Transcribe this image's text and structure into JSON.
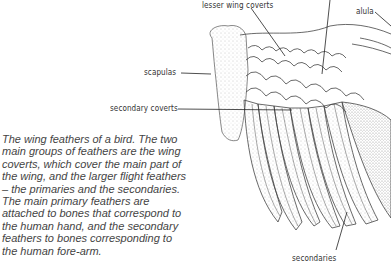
{
  "diagram": {
    "labels": [
      {
        "id": "lesser-wing-coverts",
        "text": "lesser wing coverts"
      },
      {
        "id": "alula",
        "text": "alula"
      },
      {
        "id": "scapulas",
        "text": "scapulas"
      },
      {
        "id": "secondary-coverts",
        "text": "secondary coverts"
      },
      {
        "id": "secondaries",
        "text": "secondaries"
      }
    ],
    "caption": "The wing feathers of a bird. The two main groups of feathers are the wing coverts, which cover the main part of the wing, and the larger flight feathers – the primaries and the secondaries. The main primary feathers are attached to bones that correspond to the human hand, and the secondary feathers to bones corresponding to the human fore-arm.",
    "colors": {
      "ink": "#333333",
      "stipple": "#9a9a9a",
      "background": "#ffffff"
    }
  }
}
